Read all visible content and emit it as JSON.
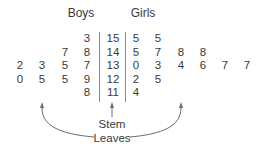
{
  "chart_data": {
    "type": "table",
    "headers": {
      "left": "Boys",
      "right": "Girls"
    },
    "rows": [
      {
        "stem": "15",
        "boys": [
          "3"
        ],
        "girls": [
          "5",
          "5"
        ]
      },
      {
        "stem": "14",
        "boys": [
          "7",
          "8"
        ],
        "girls": [
          "5",
          "7",
          "8",
          "8"
        ]
      },
      {
        "stem": "13",
        "boys": [
          "2",
          "3",
          "5",
          "7"
        ],
        "girls": [
          "0",
          "3",
          "4",
          "6",
          "7",
          "7"
        ]
      },
      {
        "stem": "12",
        "boys": [
          "0",
          "5",
          "5",
          "9"
        ],
        "girls": [
          "2",
          "5"
        ]
      },
      {
        "stem": "11",
        "boys": [
          "8"
        ],
        "girls": [
          "4"
        ]
      }
    ],
    "annotations": [
      "Stem",
      "Leaves"
    ]
  },
  "labels": {
    "boys": "Boys",
    "girls": "Girls",
    "stem": "Stem",
    "leaves": "Leaves"
  },
  "colors": {
    "text": "#3a3a3a",
    "lines": "#8a8a8a"
  }
}
